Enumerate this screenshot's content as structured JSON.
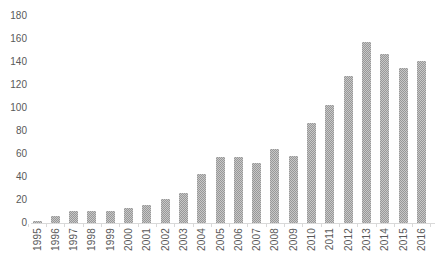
{
  "chart_data": {
    "type": "bar",
    "title": "",
    "xlabel": "",
    "ylabel": "",
    "categories": [
      "1995",
      "1996",
      "1997",
      "1998",
      "1999",
      "2000",
      "2001",
      "2002",
      "2003",
      "2004",
      "2005",
      "2006",
      "2007",
      "2008",
      "2009",
      "2010",
      "2011",
      "2012",
      "2013",
      "2014",
      "2015",
      "2016"
    ],
    "values": [
      2,
      6,
      10,
      10,
      10,
      13,
      16,
      21,
      26,
      43,
      57,
      57,
      52,
      64,
      58,
      87,
      103,
      128,
      157,
      147,
      135,
      141
    ],
    "ylim": [
      0,
      180
    ],
    "yticks": [
      0,
      20,
      40,
      60,
      80,
      100,
      120,
      140,
      160,
      180
    ],
    "grid": "off",
    "legend": "none",
    "bar_color": "#a6a6a6",
    "bar_pattern": "dotted-grid",
    "axis_text_color": "#595959",
    "axis_line_color": "#d9d9d9",
    "background_color": "#ffffff",
    "x_label_rotation_degrees": 90
  }
}
